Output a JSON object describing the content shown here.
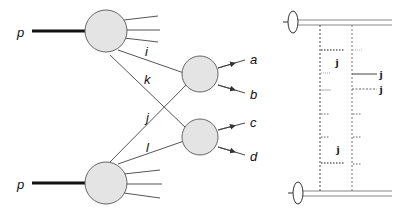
{
  "left_diagram": {
    "name": "parton-scattering-diagram",
    "incoming": [
      {
        "label": "p",
        "position": "top"
      },
      {
        "label": "p",
        "position": "bottom"
      }
    ],
    "internal_lines": [
      {
        "label": "i"
      },
      {
        "label": "k"
      },
      {
        "label": "j"
      },
      {
        "label": "l"
      }
    ],
    "outgoing": [
      {
        "label": "a"
      },
      {
        "label": "b"
      },
      {
        "label": "c"
      },
      {
        "label": "d"
      }
    ],
    "blob_fill": "#e4e4e4",
    "blob_stroke": "#666666"
  },
  "right_diagram": {
    "name": "ladder-diagram",
    "labels": [
      {
        "label": "j",
        "position": "upper-rung"
      },
      {
        "label": "j",
        "position": "right-solid"
      },
      {
        "label": "j",
        "position": "right-dashed"
      },
      {
        "label": "j",
        "position": "lower-rung"
      }
    ]
  }
}
